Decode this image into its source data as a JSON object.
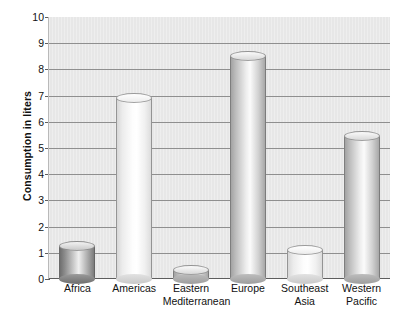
{
  "chart_data": {
    "type": "bar",
    "title": "",
    "subtitle": "",
    "xlabel": "",
    "ylabel": "Consumption in liters",
    "ylim": [
      0,
      10
    ],
    "ytick_values": [
      0,
      1,
      2,
      3,
      4,
      5,
      6,
      7,
      8,
      9,
      10
    ],
    "ytick_labels": [
      "0",
      "1",
      "2",
      "3",
      "4",
      "5",
      "6",
      "7",
      "8",
      "9",
      "10"
    ],
    "grid": true,
    "legend": false,
    "legend_position": "none",
    "categories": [
      "Africa",
      "Eastern Mediterranean",
      "Americas",
      "Europe",
      "Southeast Asia",
      "Western Pacific"
    ],
    "bars": [
      {
        "category": "Africa",
        "label_lines": [
          "Africa"
        ],
        "value": 1.25,
        "shade": "dark"
      },
      {
        "category": "Americas",
        "label_lines": [
          "Americas"
        ],
        "value": 6.9,
        "shade": "light"
      },
      {
        "category": "Eastern Mediterranean",
        "label_lines": [
          "Eastern",
          "Mediterranean"
        ],
        "value": 0.35,
        "shade": "medium"
      },
      {
        "category": "Europe",
        "label_lines": [
          "Europe"
        ],
        "value": 8.5,
        "shade": "medium"
      },
      {
        "category": "Southeast Asia",
        "label_lines": [
          "Southeast",
          "Asia"
        ],
        "value": 1.1,
        "shade": "light"
      },
      {
        "category": "Western Pacific",
        "label_lines": [
          "Western",
          "Pacific"
        ],
        "value": 5.45,
        "shade": "medium"
      }
    ],
    "values": [
      1.25,
      6.9,
      0.35,
      8.5,
      1.1,
      5.45
    ]
  },
  "style": {
    "plot_background": "#e9e9e9",
    "gridline_color": "#8f8f8f",
    "axis_color": "#5d5d5d",
    "text_color": "#111111",
    "page_background": "#ffffff"
  }
}
